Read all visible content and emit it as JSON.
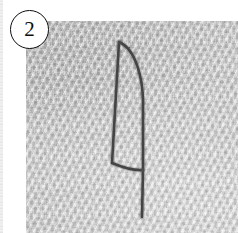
{
  "figure": {
    "badge_number": "2",
    "badge_icon": "circled-number-badge",
    "caption": "",
    "panel_width": 238,
    "panel_height": 233
  },
  "photo": {
    "subject": "textured gray plaster wall with a drawn blade outline",
    "surface_color": "#c6c6c6",
    "surface_highlight": "#d6d6d6",
    "surface_shadow": "#adadad",
    "left": 26,
    "top": 21,
    "width": 212,
    "height": 212
  },
  "drawing": {
    "name": "blade-outline",
    "stroke_color": "#3a3a3c",
    "stroke_width": 2.6,
    "description": "Pencil outline of a curved blade: a near-vertical left edge, a convex right edge meeting it at a pointed tip, a slanted heel line, and a long tang line continuing below.",
    "paths": [
      {
        "name": "left-edge",
        "d": "M 93 21 L 86 142"
      },
      {
        "name": "right-curved-edge",
        "d": "M 93 21 C 110 28 117 58 117 82 L 117 149"
      },
      {
        "name": "heel-line",
        "d": "M 86 142 C 98 147 108 150 117 149"
      },
      {
        "name": "tang-line",
        "d": "M 117 149 L 116 196"
      }
    ],
    "tip_point": [
      93,
      21
    ],
    "widest_x": 117,
    "bottom_y": 196
  },
  "edge_sliver": {
    "name": "adjacent-panel-sliver",
    "visible": true
  }
}
